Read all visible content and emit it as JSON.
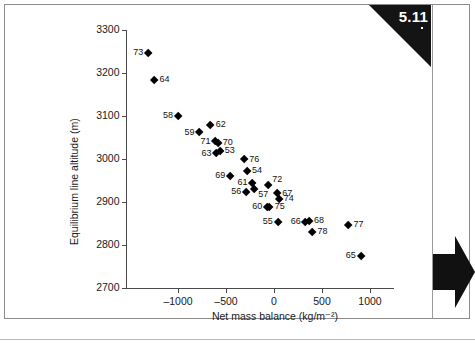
{
  "figure": {
    "number": "5.11",
    "badge_color": "#141414"
  },
  "chart_data": {
    "type": "scatter",
    "title": "",
    "xlabel": "Net mass balance (kg/m⁻²)",
    "ylabel": "Equilibrium line altitude (m)",
    "xlim": [
      -1400,
      1100
    ],
    "ylim": [
      2700,
      3300
    ],
    "xticks": [
      -1000,
      -500,
      0,
      500,
      1000
    ],
    "xtick_labels": [
      "–1000",
      "–500",
      "0",
      "500",
      "1000"
    ],
    "yticks": [
      2700,
      2800,
      2900,
      3000,
      3100,
      3200,
      3300
    ],
    "ytick_labels": [
      "2700",
      "2800",
      "2900",
      "3000",
      "3100",
      "3200",
      "3300"
    ],
    "grid": false,
    "legend": false,
    "marker": "diamond",
    "marker_color": "#000000",
    "point_label_meaning": "year",
    "points": [
      {
        "label": "73",
        "x": -1310,
        "y": 3247,
        "label_pos": "left"
      },
      {
        "label": "64",
        "x": -1245,
        "y": 3183,
        "label_pos": "right"
      },
      {
        "label": "58",
        "x": -1000,
        "y": 3100,
        "label_pos": "left"
      },
      {
        "label": "62",
        "x": -660,
        "y": 3079,
        "label_pos": "right"
      },
      {
        "label": "59",
        "x": -775,
        "y": 3061,
        "label_pos": "left"
      },
      {
        "label": "71",
        "x": -610,
        "y": 3040,
        "label_pos": "left"
      },
      {
        "label": "70",
        "x": -585,
        "y": 3036,
        "label_pos": "right"
      },
      {
        "label": "63",
        "x": -600,
        "y": 3012,
        "label_pos": "left"
      },
      {
        "label": "53",
        "x": -565,
        "y": 3018,
        "label_pos": "right"
      },
      {
        "label": "76",
        "x": -310,
        "y": 2998,
        "label_pos": "right"
      },
      {
        "label": "54",
        "x": -280,
        "y": 2971,
        "label_pos": "right"
      },
      {
        "label": "69",
        "x": -455,
        "y": 2960,
        "label_pos": "left"
      },
      {
        "label": "61",
        "x": -225,
        "y": 2944,
        "label_pos": "left"
      },
      {
        "label": "72",
        "x": -60,
        "y": 2939,
        "label_pos": "above"
      },
      {
        "label": "56",
        "x": -290,
        "y": 2922,
        "label_pos": "left"
      },
      {
        "label": "57",
        "x": -205,
        "y": 2930,
        "label_pos": "below"
      },
      {
        "label": "67",
        "x": 35,
        "y": 2919,
        "label_pos": "right"
      },
      {
        "label": "74",
        "x": 50,
        "y": 2906,
        "label_pos": "right"
      },
      {
        "label": "60",
        "x": -70,
        "y": 2887,
        "label_pos": "left"
      },
      {
        "label": "75",
        "x": -45,
        "y": 2887,
        "label_pos": "right"
      },
      {
        "label": "55",
        "x": 40,
        "y": 2852,
        "label_pos": "left"
      },
      {
        "label": "66",
        "x": 330,
        "y": 2852,
        "label_pos": "left"
      },
      {
        "label": "68",
        "x": 365,
        "y": 2855,
        "label_pos": "right"
      },
      {
        "label": "78",
        "x": 400,
        "y": 2830,
        "label_pos": "right"
      },
      {
        "label": "77",
        "x": 775,
        "y": 2845,
        "label_pos": "right"
      },
      {
        "label": "65",
        "x": 905,
        "y": 2774,
        "label_pos": "left"
      }
    ]
  }
}
